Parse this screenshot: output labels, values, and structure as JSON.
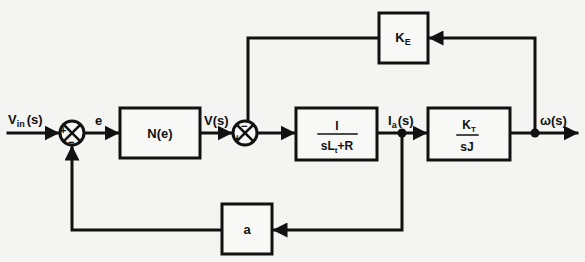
{
  "diagram": {
    "type": "block-diagram",
    "input": {
      "label_main": "V",
      "label_sub": "in",
      "label_rest": "(s)"
    },
    "output": {
      "label": "ω(s)"
    },
    "summing_junctions": [
      {
        "id": "sum1",
        "signs": {
          "plus": "+",
          "minus": "−"
        }
      },
      {
        "id": "sum2",
        "signs": {
          "plus": "+",
          "minus": "−"
        }
      }
    ],
    "signals": {
      "error": "e",
      "voltage": "V(s)",
      "current_main": "I",
      "current_sub": "a",
      "current_rest": "(s)"
    },
    "blocks": {
      "nonlinearity": {
        "label": "N(e)"
      },
      "electrical": {
        "numerator": "I",
        "den_part1": "sL",
        "den_sub": "t",
        "den_part2": "+R"
      },
      "mechanical": {
        "num_main": "K",
        "num_sub": "T",
        "denominator": "sJ"
      },
      "back_emf": {
        "main": "K",
        "sub": "E"
      },
      "current_feedback": {
        "label": "a"
      }
    }
  }
}
